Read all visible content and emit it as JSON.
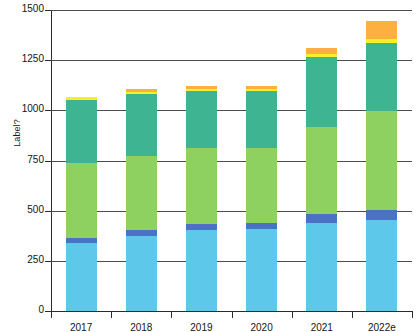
{
  "chart_data": {
    "type": "bar",
    "title": "",
    "subtitle": "",
    "xlabel": "",
    "ylabel": "Label?",
    "ylim": [
      0,
      1500
    ],
    "yticks": [
      0,
      250,
      500,
      750,
      1000,
      1250,
      1500
    ],
    "ytick_labels": [
      "0",
      "250",
      "500",
      "750",
      "1000",
      "1250",
      "1500"
    ],
    "grid": true,
    "stacked": true,
    "legend": "none",
    "categories": [
      "2017",
      "2018",
      "2019",
      "2020",
      "2021",
      "2022e"
    ],
    "series": [
      {
        "name": "Series 1",
        "color": "#5ec8ea",
        "values": [
          340,
          375,
          405,
          410,
          440,
          455
        ]
      },
      {
        "name": "Series 2",
        "color": "#4a72c4",
        "values": [
          25,
          30,
          30,
          30,
          45,
          50
        ]
      },
      {
        "name": "Series 3",
        "color": "#8fd161",
        "values": [
          375,
          370,
          375,
          370,
          430,
          490
        ]
      },
      {
        "name": "Series 4",
        "color": "#3fb493",
        "values": [
          310,
          305,
          285,
          285,
          350,
          340
        ]
      },
      {
        "name": "Series 5",
        "color": "#f5f02a",
        "values": [
          15,
          12,
          10,
          10,
          15,
          20
        ]
      },
      {
        "name": "Series 6",
        "color": "#fbb040",
        "values": [
          0,
          13,
          15,
          15,
          30,
          90
        ]
      }
    ],
    "totals": [
      1065,
      1105,
      1120,
      1120,
      1310,
      1445
    ]
  }
}
